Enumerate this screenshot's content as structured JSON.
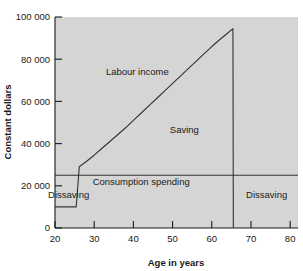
{
  "chart_data": {
    "type": "line",
    "title": "",
    "xlabel": "Age in years",
    "ylabel": "Constant dollars",
    "xlim": [
      20,
      82
    ],
    "ylim": [
      0,
      100000
    ],
    "grid": false,
    "legend": null,
    "xticks": [
      "20",
      "30",
      "40",
      "50",
      "60",
      "70",
      "80"
    ],
    "xtick_values": [
      20,
      30,
      40,
      50,
      60,
      70,
      80
    ],
    "yticks": [
      "0",
      "20 000",
      "40 000",
      "60 000",
      "80 000",
      "100 000"
    ],
    "ytick_values": [
      0,
      20000,
      40000,
      60000,
      80000,
      100000
    ],
    "plot_bgcolor": "#d5d5d5",
    "line_color": "#333333",
    "series": [
      {
        "name": "Labour income",
        "points": [
          [
            20,
            10000
          ],
          [
            25.4,
            10000
          ],
          [
            26.2,
            29000
          ],
          [
            28,
            31500
          ],
          [
            30,
            34500
          ],
          [
            32,
            37800
          ],
          [
            34,
            41000
          ],
          [
            36,
            44200
          ],
          [
            38,
            47500
          ],
          [
            40,
            51000
          ],
          [
            42,
            54500
          ],
          [
            44,
            58000
          ],
          [
            46,
            61500
          ],
          [
            48,
            65000
          ],
          [
            50,
            68500
          ],
          [
            52,
            72000
          ],
          [
            54,
            75500
          ],
          [
            56,
            79000
          ],
          [
            58,
            82500
          ],
          [
            60,
            86000
          ],
          [
            62,
            89200
          ],
          [
            64,
            92300
          ],
          [
            65.4,
            94500
          ],
          [
            65.5,
            0
          ]
        ]
      },
      {
        "name": "Consumption spending",
        "points": [
          [
            20,
            25000
          ],
          [
            82,
            25000
          ]
        ]
      }
    ],
    "annotations": [
      {
        "text": "Labour income",
        "x": 41,
        "y": 72500
      },
      {
        "text": "Saving",
        "x": 53,
        "y": 45000
      },
      {
        "text": "Consumption spending",
        "x": 42,
        "y": 20500
      },
      {
        "text": "Dissaving",
        "x": 23.5,
        "y": 14000
      },
      {
        "text": "Dissaving",
        "x": 74,
        "y": 14000
      }
    ]
  }
}
